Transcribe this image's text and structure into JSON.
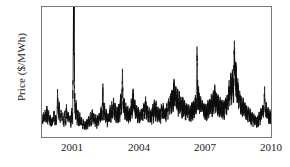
{
  "chart_data": {
    "type": "line",
    "title": "",
    "xlabel": "",
    "ylabel": "Price ($/MWh)",
    "xlim": [
      1999.6,
      2010.0
    ],
    "ylim": [
      0,
      240
    ],
    "yticks": [
      0,
      100,
      200
    ],
    "ytick_labels": [
      "0",
      "100",
      "200"
    ],
    "xticks": [
      2001,
      2004,
      2007,
      2010
    ],
    "xtick_labels": [
      "2001",
      "2004",
      "2007",
      "2010"
    ],
    "grid": false,
    "legend": null,
    "series": [
      {
        "name": "Electricity price",
        "color": "#0d0d0d",
        "units": "$/MWh",
        "annotation": "Daily/weekly wholesale electricity price series with a clipped spike near early 2001 exceeding the plotted y-range",
        "x": [
          1999.62,
          1999.66,
          1999.7,
          1999.74,
          1999.78,
          1999.82,
          1999.86,
          1999.9,
          1999.94,
          1999.98,
          2000.02,
          2000.06,
          2000.1,
          2000.14,
          2000.18,
          2000.22,
          2000.26,
          2000.3,
          2000.34,
          2000.38,
          2000.42,
          2000.46,
          2000.5,
          2000.54,
          2000.58,
          2000.62,
          2000.66,
          2000.7,
          2000.74,
          2000.78,
          2000.82,
          2000.86,
          2000.9,
          2000.94,
          2000.98,
          2001.02,
          2001.04,
          2001.06,
          2001.1,
          2001.14,
          2001.18,
          2001.22,
          2001.26,
          2001.3,
          2001.34,
          2001.38,
          2001.42,
          2001.46,
          2001.5,
          2001.54,
          2001.58,
          2001.62,
          2001.66,
          2001.7,
          2001.74,
          2001.78,
          2001.82,
          2001.86,
          2001.9,
          2001.94,
          2001.98,
          2002.02,
          2002.06,
          2002.1,
          2002.14,
          2002.18,
          2002.22,
          2002.26,
          2002.3,
          2002.34,
          2002.38,
          2002.42,
          2002.46,
          2002.5,
          2002.54,
          2002.58,
          2002.62,
          2002.66,
          2002.7,
          2002.74,
          2002.78,
          2002.82,
          2002.86,
          2002.9,
          2002.94,
          2002.98,
          2003.02,
          2003.06,
          2003.1,
          2003.14,
          2003.18,
          2003.22,
          2003.26,
          2003.3,
          2003.34,
          2003.38,
          2003.42,
          2003.46,
          2003.5,
          2003.54,
          2003.58,
          2003.62,
          2003.66,
          2003.7,
          2003.74,
          2003.78,
          2003.82,
          2003.86,
          2003.9,
          2003.94,
          2003.98,
          2004.02,
          2004.06,
          2004.1,
          2004.14,
          2004.18,
          2004.22,
          2004.26,
          2004.3,
          2004.34,
          2004.38,
          2004.42,
          2004.46,
          2004.5,
          2004.54,
          2004.58,
          2004.62,
          2004.66,
          2004.7,
          2004.74,
          2004.78,
          2004.82,
          2004.86,
          2004.9,
          2004.94,
          2004.98,
          2005.02,
          2005.06,
          2005.1,
          2005.14,
          2005.18,
          2005.22,
          2005.26,
          2005.3,
          2005.34,
          2005.38,
          2005.42,
          2005.46,
          2005.5,
          2005.54,
          2005.58,
          2005.62,
          2005.66,
          2005.7,
          2005.74,
          2005.78,
          2005.82,
          2005.86,
          2005.9,
          2005.94,
          2005.98,
          2006.02,
          2006.06,
          2006.1,
          2006.14,
          2006.18,
          2006.22,
          2006.26,
          2006.3,
          2006.34,
          2006.38,
          2006.42,
          2006.46,
          2006.5,
          2006.54,
          2006.58,
          2006.62,
          2006.66,
          2006.7,
          2006.74,
          2006.78,
          2006.82,
          2006.86,
          2006.9,
          2006.94,
          2006.98,
          2007.02,
          2007.06,
          2007.1,
          2007.14,
          2007.18,
          2007.22,
          2007.26,
          2007.3,
          2007.34,
          2007.38,
          2007.42,
          2007.46,
          2007.5,
          2007.54,
          2007.58,
          2007.62,
          2007.66,
          2007.7,
          2007.74,
          2007.78,
          2007.82,
          2007.86,
          2007.9,
          2007.94,
          2007.98,
          2008.02,
          2008.06,
          2008.1,
          2008.14,
          2008.18,
          2008.22,
          2008.26,
          2008.3,
          2008.34,
          2008.38,
          2008.42,
          2008.46,
          2008.5,
          2008.54,
          2008.58,
          2008.62,
          2008.66,
          2008.7,
          2008.74,
          2008.78,
          2008.82,
          2008.86,
          2008.9,
          2008.94,
          2008.98,
          2009.02,
          2009.06,
          2009.1,
          2009.14,
          2009.18,
          2009.22,
          2009.26,
          2009.3,
          2009.34,
          2009.38,
          2009.42,
          2009.46,
          2009.5,
          2009.54,
          2009.58,
          2009.62,
          2009.66,
          2009.7,
          2009.74,
          2009.78,
          2009.82,
          2009.86,
          2009.9,
          2009.94,
          2009.98,
          2010.0
        ],
        "y": [
          30,
          44,
          33,
          52,
          35,
          60,
          38,
          47,
          31,
          40,
          28,
          36,
          30,
          50,
          34,
          42,
          31,
          83,
          45,
          62,
          36,
          50,
          33,
          44,
          29,
          48,
          35,
          58,
          38,
          46,
          30,
          42,
          33,
          55,
          40,
          240,
          238,
          92,
          50,
          66,
          38,
          52,
          30,
          44,
          27,
          38,
          25,
          33,
          22,
          30,
          24,
          36,
          26,
          40,
          30,
          46,
          33,
          52,
          36,
          45,
          30,
          41,
          28,
          38,
          31,
          44,
          35,
          55,
          40,
          95,
          52,
          60,
          38,
          50,
          33,
          46,
          36,
          58,
          42,
          66,
          45,
          70,
          48,
          62,
          40,
          54,
          44,
          63,
          48,
          78,
          55,
          118,
          62,
          72,
          50,
          60,
          43,
          55,
          40,
          52,
          45,
          68,
          50,
          86,
          55,
          66,
          46,
          58,
          42,
          54,
          38,
          48,
          40,
          52,
          44,
          64,
          48,
          72,
          52,
          60,
          44,
          55,
          40,
          50,
          42,
          58,
          46,
          68,
          50,
          62,
          45,
          56,
          42,
          52,
          44,
          60,
          46,
          58,
          44,
          54,
          46,
          62,
          50,
          70,
          56,
          78,
          60,
          88,
          66,
          102,
          72,
          96,
          68,
          86,
          62,
          78,
          58,
          74,
          55,
          70,
          52,
          64,
          50,
          60,
          48,
          58,
          46,
          56,
          48,
          62,
          52,
          68,
          55,
          72,
          58,
          168,
          78,
          88,
          62,
          72,
          55,
          66,
          50,
          60,
          48,
          58,
          50,
          64,
          54,
          70,
          58,
          76,
          62,
          82,
          66,
          92,
          70,
          84,
          64,
          76,
          58,
          70,
          54,
          66,
          52,
          64,
          56,
          72,
          60,
          80,
          68,
          96,
          76,
          108,
          84,
          122,
          94,
          170,
          112,
          124,
          86,
          98,
          72,
          84,
          64,
          76,
          58,
          68,
          52,
          62,
          48,
          58,
          44,
          54,
          40,
          50,
          38,
          46,
          34,
          44,
          32,
          40,
          30,
          38,
          34,
          46,
          38,
          52,
          42,
          58,
          46,
          88,
          54,
          62,
          44,
          52,
          40,
          48,
          38,
          50,
          44,
          62
        ]
      }
    ]
  }
}
